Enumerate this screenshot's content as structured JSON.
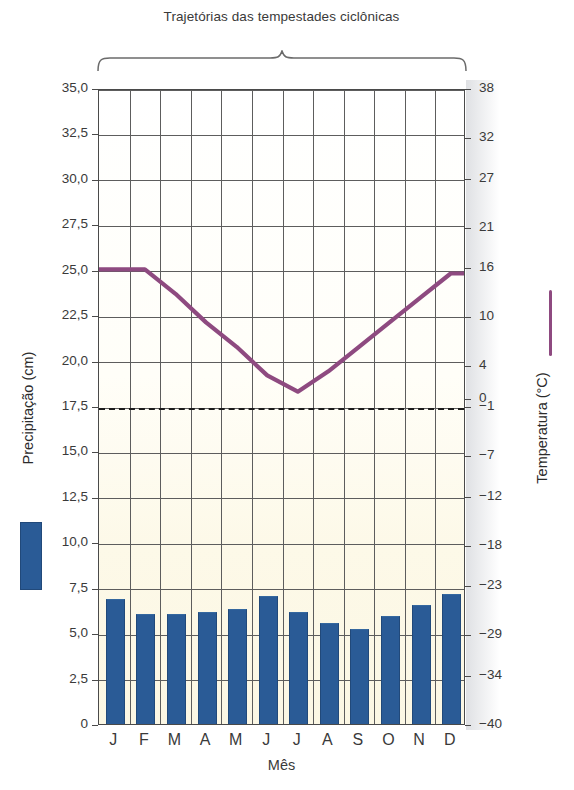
{
  "title": "Trajetórias das tempestades ciclônicas",
  "axis": {
    "x_title": "Mês",
    "y_left_title": "Precipitação (cm)",
    "y_right_title": "Temperatura (°C)"
  },
  "legend": {
    "precipitation_swatch": "blue-bar-swatch",
    "temperature_swatch": "purple-line-swatch"
  },
  "colors": {
    "bar": "#2a5b96",
    "line": "#8e4a80",
    "grid": "#5d5d5d",
    "plot_background": "#fdfbf0",
    "frame": "#4a4a4a"
  },
  "chart_data": {
    "type": "bar",
    "title": "Trajetórias das tempestades ciclônicas",
    "xlabel": "Mês",
    "ylabel": "Precipitação (cm)",
    "y2label": "Temperatura (°C)",
    "grid": true,
    "legend_position": "outside-left-and-right",
    "categories": [
      "J",
      "F",
      "M",
      "A",
      "M",
      "J",
      "J",
      "A",
      "S",
      "O",
      "N",
      "D"
    ],
    "ylim": [
      0,
      35
    ],
    "yticks": [
      0,
      2.5,
      5.0,
      7.5,
      10.0,
      12.5,
      15.0,
      17.5,
      20.0,
      22.5,
      25.0,
      27.5,
      30.0,
      32.5,
      35.0
    ],
    "ytick_labels": [
      "0",
      "2,5",
      "5,0",
      "7,5",
      "10,0",
      "12,5",
      "15,0",
      "17,5",
      "20,0",
      "22,5",
      "25,0",
      "27,5",
      "30,0",
      "32,5",
      "35,0"
    ],
    "y2lim": [
      -40,
      38
    ],
    "y2ticks": [
      -40,
      -34,
      -29,
      -23,
      -18,
      -12,
      -7,
      -1,
      0,
      4,
      10,
      16,
      21,
      27,
      32,
      38
    ],
    "y2tick_labels": [
      "−40",
      "−34",
      "−29",
      "−23",
      "−18",
      "−12",
      "−7",
      "−1",
      "0",
      "4",
      "10",
      "16",
      "21",
      "27",
      "32",
      "38"
    ],
    "series": [
      {
        "name": "Precipitação (cm)",
        "type": "bar",
        "axis": "left",
        "color": "#2a5b96",
        "values": [
          6.8,
          6.0,
          6.0,
          6.1,
          6.3,
          7.0,
          6.1,
          5.5,
          5.2,
          5.9,
          6.5,
          7.1
        ]
      },
      {
        "name": "Temperatura (°C)",
        "type": "line",
        "axis": "right",
        "color": "#8e4a80",
        "values": [
          16.0,
          16.0,
          13.0,
          9.5,
          6.5,
          3.0,
          1.0,
          3.5,
          6.5,
          9.5,
          12.5,
          15.5
        ]
      }
    ],
    "annotations": [
      {
        "name": "freezing-dashed-line",
        "axis": "right",
        "value": -1,
        "style": "dashed"
      }
    ]
  }
}
